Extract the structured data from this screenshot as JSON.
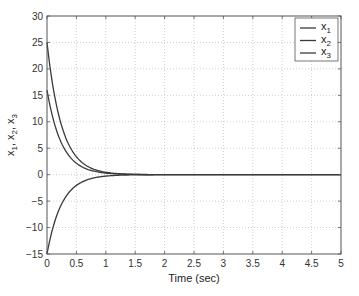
{
  "chart_data": {
    "type": "line",
    "title": "",
    "xlabel": "Time (sec)",
    "ylabel": "x1, x2, x3",
    "xlim": [
      0,
      5
    ],
    "ylim": [
      -15,
      30
    ],
    "xticks": [
      0,
      0.5,
      1,
      1.5,
      2,
      2.5,
      3,
      3.5,
      4,
      4.5,
      5
    ],
    "xtick_labels": [
      "0",
      "0.5",
      "1",
      "1.5",
      "2",
      "2.5",
      "3",
      "3.5",
      "4",
      "4.5",
      "5"
    ],
    "yticks": [
      -15,
      -10,
      -5,
      0,
      5,
      10,
      15,
      20,
      25,
      30
    ],
    "ytick_labels": [
      "−15",
      "−10",
      "−5",
      "0",
      "5",
      "10",
      "15",
      "20",
      "25",
      "30"
    ],
    "grid": true,
    "legend_position": "upper right",
    "series": [
      {
        "name": "x1",
        "initial": 25,
        "decay_rate": 4,
        "points": [
          [
            0,
            25
          ],
          [
            0.25,
            9.2
          ],
          [
            0.5,
            3.4
          ],
          [
            0.75,
            1.2
          ],
          [
            1,
            0.46
          ],
          [
            1.5,
            0.06
          ],
          [
            2,
            0
          ],
          [
            5,
            0
          ]
        ]
      },
      {
        "name": "x2",
        "initial": 16,
        "decay_rate": 4,
        "points": [
          [
            0,
            16
          ],
          [
            0.25,
            5.9
          ],
          [
            0.5,
            2.2
          ],
          [
            0.75,
            0.8
          ],
          [
            1,
            0.29
          ],
          [
            1.5,
            0.04
          ],
          [
            2,
            0
          ],
          [
            5,
            0
          ]
        ]
      },
      {
        "name": "x3",
        "initial": -15,
        "decay_rate": 4,
        "points": [
          [
            0,
            -15
          ],
          [
            0.25,
            -5.5
          ],
          [
            0.5,
            -2.0
          ],
          [
            0.75,
            -0.75
          ],
          [
            1,
            -0.27
          ],
          [
            1.5,
            -0.04
          ],
          [
            2,
            0
          ],
          [
            5,
            0
          ]
        ]
      }
    ]
  },
  "legend": {
    "items": [
      {
        "label": "x",
        "sub": "1"
      },
      {
        "label": "x",
        "sub": "2"
      },
      {
        "label": "x",
        "sub": "3"
      }
    ]
  },
  "axes": {
    "xlabel": "Time (sec)",
    "ylabel_parts": [
      {
        "t": "x",
        "s": "1"
      },
      {
        "t": "x",
        "s": "2"
      },
      {
        "t": "x",
        "s": "3"
      }
    ]
  },
  "colors": {
    "line": "#3a3a3a",
    "grid": "#b0b0b0",
    "axis": "#555555"
  }
}
